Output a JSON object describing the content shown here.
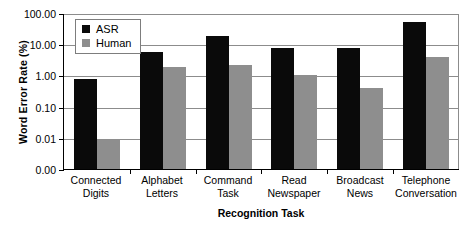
{
  "chart_data": {
    "type": "bar",
    "title": "",
    "xlabel": "Recognition Task",
    "ylabel": "Word Error Rate (%)",
    "yscale": "log",
    "ylim": [
      0.001,
      100
    ],
    "ytick_labels": [
      "100.00",
      "10.00",
      "1.00",
      "0.10",
      "0.01",
      "0.00"
    ],
    "ytick_values": [
      100,
      10,
      1,
      0.1,
      0.01,
      0.001
    ],
    "grid": true,
    "legend_position": "upper-left-inside",
    "categories": [
      "Connected Digits",
      "Alphabet Letters",
      "Command Task",
      "Read Newspaper",
      "Broadcast News",
      "Telephone Conversation"
    ],
    "category_lines": [
      [
        "Connected",
        "Digits"
      ],
      [
        "Alphabet",
        "Letters"
      ],
      [
        "Command",
        "Task"
      ],
      [
        "Read",
        "Newspaper"
      ],
      [
        "Broadcast",
        "News"
      ],
      [
        "Telephone",
        "Conversation"
      ]
    ],
    "series": [
      {
        "name": "ASR",
        "color": "#0a0a0a",
        "values": [
          0.75,
          5.5,
          18.0,
          7.8,
          7.3,
          50.0
        ]
      },
      {
        "name": "Human",
        "color": "#8e8e8e",
        "values": [
          0.009,
          1.9,
          2.2,
          1.0,
          0.4,
          4.0
        ]
      }
    ]
  },
  "legend": {
    "items": [
      {
        "label": "ASR",
        "swatch": "asr"
      },
      {
        "label": "Human",
        "swatch": "human"
      }
    ]
  }
}
